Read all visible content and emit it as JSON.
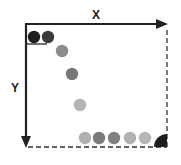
{
  "diagram": {
    "x_label": "X",
    "y_label": "Y",
    "colors": {
      "axis": "#222222",
      "dashed_border": "#333333",
      "corner_wedge": "#1e1e1e"
    },
    "top_left_circles": [
      {
        "cx": 34,
        "cy": 37,
        "fill": "#1f1f1f"
      },
      {
        "cx": 48,
        "cy": 37,
        "fill": "#3a3a3a"
      }
    ],
    "diagonal_circles": [
      {
        "cx": 62,
        "cy": 51,
        "fill": "#8c8c8c"
      },
      {
        "cx": 72,
        "cy": 74,
        "fill": "#777777"
      },
      {
        "cx": 80,
        "cy": 105,
        "fill": "#b4b4b4"
      }
    ],
    "bottom_circles": [
      {
        "cx": 85,
        "cy": 138,
        "fill": "#b0b0b0"
      },
      {
        "cx": 99,
        "cy": 138,
        "fill": "#7a7a7a"
      },
      {
        "cx": 114,
        "cy": 138,
        "fill": "#808080"
      },
      {
        "cx": 130,
        "cy": 138,
        "fill": "#b2b2b2"
      },
      {
        "cx": 145,
        "cy": 138,
        "fill": "#b6b6b6"
      }
    ]
  }
}
